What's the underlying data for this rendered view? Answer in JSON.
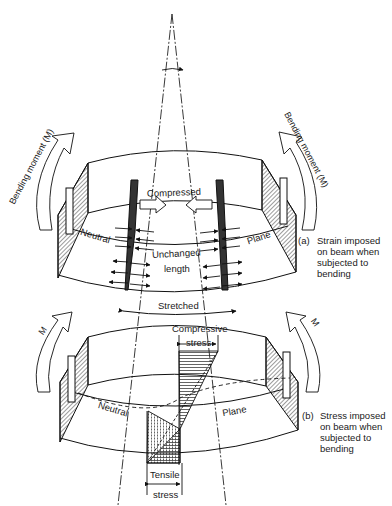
{
  "diagram": {
    "apex_angle_marker": "angle",
    "top_beam": {
      "labels": {
        "compressed": "Compressed",
        "neutral": "Neutral",
        "plane": "Plane",
        "unchanged_1": "Unchanged",
        "unchanged_2": "length",
        "stretched": "Stretched"
      },
      "left_moment": "Bending moment (M)",
      "right_moment": "Bending moment (M)",
      "caption": {
        "marker": "(a)",
        "line1": "Strain imposed",
        "line2": "on beam when",
        "line3": "subjected to",
        "line4": "bending"
      }
    },
    "bottom_beam": {
      "labels": {
        "compressive_1": "Compressive",
        "compressive_2": "stress",
        "neutral": "Neutral",
        "plane": "Plane",
        "tensile_1": "Tensile",
        "tensile_2": "stress"
      },
      "left_moment": "M",
      "right_moment": "M",
      "caption": {
        "marker": "(b)",
        "line1": "Stress imposed",
        "line2": "on beam when",
        "line3": "subjected to",
        "line4": "bending"
      }
    }
  }
}
